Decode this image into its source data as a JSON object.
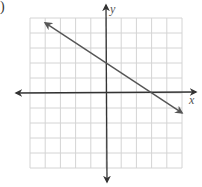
{
  "label_fragment": ")",
  "chart_data": {
    "type": "line",
    "title": "",
    "xlabel": "x",
    "ylabel": "y",
    "xlim": [
      -5,
      5
    ],
    "ylim": [
      -5,
      5
    ],
    "grid": true,
    "grid_step": 1,
    "series": [
      {
        "name": "line",
        "equation": "y = -2/3 x + 2",
        "slope": -0.6667,
        "intercept": 2,
        "x": [
          -4,
          5
        ],
        "y": [
          4.67,
          -1.33
        ],
        "arrows": "both"
      }
    ],
    "points_of_interest": {
      "y_intercept": [
        0,
        2
      ],
      "x_intercept": [
        3,
        0
      ]
    },
    "colors": {
      "grid": "#d4d4d4",
      "axes": "#333333",
      "line": "#555555"
    }
  }
}
